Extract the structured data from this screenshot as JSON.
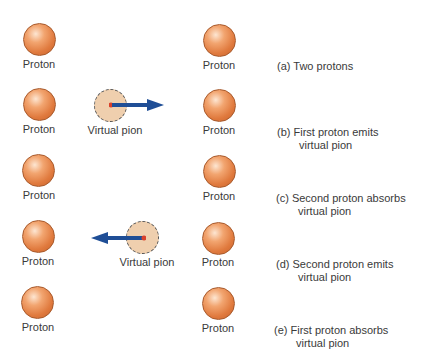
{
  "rows": [
    {
      "left_label": "Proton",
      "right_label": "Proton",
      "caption_1": "(a) Two protons",
      "caption_2": ""
    },
    {
      "left_label": "Proton",
      "right_label": "Proton",
      "caption_1": "(b) First proton emits",
      "caption_2": "virtual pion",
      "pion_label": "Virtual pion",
      "arrow_direction": "right"
    },
    {
      "left_label": "Proton",
      "right_label": "Proton",
      "caption_1": "(c) Second proton absorbs",
      "caption_2": "virtual pion"
    },
    {
      "left_label": "Proton",
      "right_label": "Proton",
      "caption_1": "(d) Second proton emits",
      "caption_2": "virtual pion",
      "pion_label": "Virtual pion",
      "arrow_direction": "left"
    },
    {
      "left_label": "Proton",
      "right_label": "Proton",
      "caption_1": "(e) First proton absorbs",
      "caption_2": "virtual pion"
    }
  ],
  "colors": {
    "proton": "#e07a3e",
    "pion_fill": "#efcfae",
    "arrow": "#1f4e96",
    "pion_center": "#d9402a"
  }
}
